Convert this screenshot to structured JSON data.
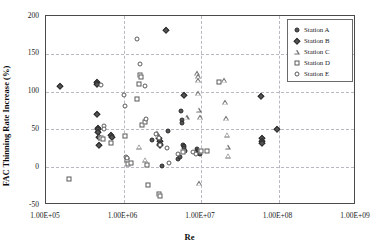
{
  "chart_data": {
    "type": "scatter",
    "title": "",
    "xlabel": "Re",
    "ylabel": "FAC Thinning Rate Increase (%)",
    "xscale": "log",
    "xlim": [
      100000,
      1000000000
    ],
    "ylim": [
      -50,
      200
    ],
    "xticks": [
      "1.00E+05",
      "1.00E+06",
      "1.00E+07",
      "1.00E+08",
      "1.00E+09"
    ],
    "xtick_values": [
      100000,
      1000000,
      10000000,
      100000000,
      1000000000
    ],
    "yticks": [
      "-50",
      "0",
      "50",
      "100",
      "150",
      "200"
    ],
    "ytick_values": [
      -50,
      0,
      50,
      100,
      150,
      200
    ],
    "grid": true,
    "legend_position": "top-right",
    "series": [
      {
        "name": "Station A",
        "marker": "filled-circle",
        "color": "#545454",
        "points": [
          [
            3100000,
            2
          ],
          [
            3700000,
            48
          ],
          [
            5000000,
            11
          ],
          [
            5300000,
            13
          ],
          [
            5600000,
            75
          ],
          [
            5700000,
            62
          ],
          [
            5750000,
            59
          ],
          [
            5900000,
            30
          ],
          [
            6000000,
            28
          ],
          [
            6100000,
            26
          ],
          [
            6300000,
            21
          ],
          [
            8900000,
            24
          ],
          [
            9200000,
            22
          ],
          [
            9500000,
            19
          ],
          [
            9700000,
            18
          ],
          [
            2300000,
            36
          ]
        ]
      },
      {
        "name": "Station B",
        "marker": "filled-diamond",
        "color": "#545454",
        "points": [
          [
            150000,
            107
          ],
          [
            450000,
            113
          ],
          [
            455000,
            110
          ],
          [
            460000,
            71
          ],
          [
            465000,
            52
          ],
          [
            470000,
            50
          ],
          [
            475000,
            47
          ],
          [
            480000,
            40
          ],
          [
            485000,
            29
          ],
          [
            700000,
            42
          ],
          [
            720000,
            40
          ],
          [
            3500000,
            182
          ],
          [
            2900000,
            38
          ],
          [
            2950000,
            35
          ],
          [
            2980000,
            31
          ],
          [
            3000000,
            29
          ],
          [
            6000000,
            95
          ],
          [
            60000000,
            94
          ],
          [
            60500000,
            38
          ],
          [
            61000000,
            35
          ],
          [
            61500000,
            32
          ],
          [
            95000000,
            51
          ]
        ]
      },
      {
        "name": "Station C",
        "marker": "open-triangle",
        "color": "#6e6e6e",
        "points": [
          [
            1600000,
            27
          ],
          [
            1900000,
            10
          ],
          [
            2700000,
            45
          ],
          [
            2750000,
            42
          ],
          [
            9000000,
            124
          ],
          [
            9050000,
            120
          ],
          [
            9100000,
            115
          ],
          [
            9200000,
            98
          ],
          [
            9300000,
            76
          ],
          [
            9400000,
            -21
          ],
          [
            9600000,
            66
          ],
          [
            20000000,
            115
          ],
          [
            20500000,
            86
          ],
          [
            21000000,
            65
          ],
          [
            21500000,
            43
          ],
          [
            22000000,
            27
          ],
          [
            22500000,
            15
          ],
          [
            6500000,
            66
          ]
        ]
      },
      {
        "name": "Station D",
        "marker": "open-square",
        "color": "#5a5a5a",
        "points": [
          [
            200000,
            -16
          ],
          [
            520000,
            39
          ],
          [
            540000,
            37
          ],
          [
            700000,
            32
          ],
          [
            1050000,
            41
          ],
          [
            1100000,
            9
          ],
          [
            1150000,
            4
          ],
          [
            1500000,
            90
          ],
          [
            1600000,
            110
          ],
          [
            1650000,
            122
          ],
          [
            1700000,
            119
          ],
          [
            1750000,
            56
          ],
          [
            1900000,
            60
          ],
          [
            2000000,
            3
          ],
          [
            2050000,
            -24
          ],
          [
            2900000,
            -35
          ],
          [
            2950000,
            -38
          ],
          [
            5800000,
            20
          ],
          [
            9900000,
            21
          ],
          [
            12000000,
            22
          ],
          [
            17000000,
            113
          ],
          [
            1250000,
            5
          ]
        ]
      },
      {
        "name": "Station E",
        "marker": "open-circle",
        "color": "#5a5a5a",
        "points": [
          [
            520000,
            109
          ],
          [
            560000,
            54
          ],
          [
            560500,
            50
          ],
          [
            1000000,
            95
          ],
          [
            1050000,
            81
          ],
          [
            1080000,
            14
          ],
          [
            1100000,
            12
          ],
          [
            1500000,
            170
          ],
          [
            1650000,
            136
          ],
          [
            1900000,
            108
          ],
          [
            1950000,
            64
          ],
          [
            2900000,
            39
          ],
          [
            3000000,
            30
          ],
          [
            3600000,
            26
          ],
          [
            3900000,
            6
          ],
          [
            5000000,
            18
          ],
          [
            8000000,
            20
          ],
          [
            8500000,
            17
          ],
          [
            2600000,
            44
          ]
        ]
      }
    ]
  },
  "legend": {
    "items": [
      {
        "label": "Station A"
      },
      {
        "label": "Station B"
      },
      {
        "label": "Station C"
      },
      {
        "label": "Station D"
      },
      {
        "label": "Station E"
      }
    ]
  },
  "colors": {
    "frame": "#4a4a4a",
    "grid": "#b9b9c4",
    "text": "#1a1a1a"
  }
}
